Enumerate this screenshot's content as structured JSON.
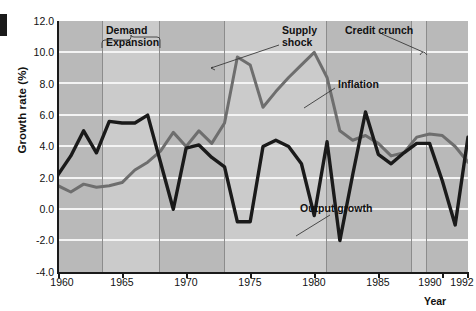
{
  "chart_data": {
    "type": "line",
    "title": "",
    "xlabel": "Year",
    "ylabel": "Growth rate (%)",
    "xlim": [
      1960,
      1992
    ],
    "ylim": [
      -4.0,
      12.0
    ],
    "grid": true,
    "legend": "inline-annotations",
    "y_ticks": [
      "12.0",
      "10.0",
      "8.0",
      "6.0",
      "4.0",
      "2.0",
      "0.0",
      "-2.0",
      "-4.0"
    ],
    "y_tick_values": [
      12.0,
      10.0,
      8.0,
      6.0,
      4.0,
      2.0,
      0.0,
      -2.0,
      -4.0
    ],
    "x_ticks": [
      "1960",
      "1965",
      "1970",
      "1975",
      "1980",
      "1985",
      "1990",
      "1992"
    ],
    "x_tick_values": [
      1960,
      1965,
      1970,
      1975,
      1980,
      1985,
      1990,
      1992
    ],
    "x": [
      1960,
      1961,
      1962,
      1963,
      1964,
      1965,
      1966,
      1967,
      1968,
      1969,
      1970,
      1971,
      1972,
      1973,
      1974,
      1975,
      1976,
      1977,
      1978,
      1979,
      1980,
      1981,
      1982,
      1983,
      1984,
      1985,
      1986,
      1987,
      1988,
      1989,
      1990,
      1991,
      1992
    ],
    "series": [
      {
        "name": "Output growth",
        "color": "#1a1a1a",
        "values": [
          2.2,
          3.4,
          5.0,
          3.6,
          5.6,
          5.5,
          5.5,
          6.0,
          3.0,
          0.0,
          3.9,
          4.1,
          3.3,
          2.7,
          -0.8,
          -0.8,
          4.0,
          4.4,
          4.0,
          2.9,
          -0.4,
          4.3,
          -2.0,
          2.2,
          6.2,
          3.5,
          2.9,
          3.6,
          4.2,
          4.2,
          1.8,
          -1.0,
          4.6
        ]
      },
      {
        "name": "Inflation",
        "color": "#6e6e6e",
        "values": [
          1.5,
          1.1,
          1.6,
          1.4,
          1.5,
          1.7,
          2.5,
          3.0,
          3.7,
          4.9,
          4.0,
          5.0,
          4.2,
          5.5,
          9.7,
          9.2,
          6.5,
          7.5,
          8.4,
          9.2,
          10.0,
          8.4,
          5.0,
          4.4,
          4.7,
          4.2,
          3.4,
          3.6,
          4.6,
          4.8,
          4.7,
          4.0,
          3.0
        ]
      }
    ],
    "annotations": [
      {
        "name": "Demand Expansion",
        "label_line_1": "Demand",
        "label_line_2": "Expansion",
        "span_start": 1963.5,
        "span_end": 1968.0
      },
      {
        "name": "Supply shock",
        "label_line_1": "Supply",
        "label_line_2": "shock",
        "span_start": 1973.0,
        "span_end": 1981.0
      },
      {
        "name": "Credit crunch",
        "label_line_1": "Credit crunch",
        "label_line_2": "",
        "span_start": 1989.8,
        "span_end": 1991.0
      },
      {
        "name": "Inflation",
        "label_line_1": "Inflation",
        "label_line_2": ""
      },
      {
        "name": "Output growth",
        "label_line_1": "Output growth",
        "label_line_2": ""
      }
    ],
    "colors": {
      "plot_background": "#b9b9b9",
      "band_background": "#cbcbcb",
      "gridline": "#f4f4f4",
      "output_growth": "#1a1a1a",
      "inflation": "#6e6e6e",
      "axis": "#1a1a1a"
    }
  }
}
